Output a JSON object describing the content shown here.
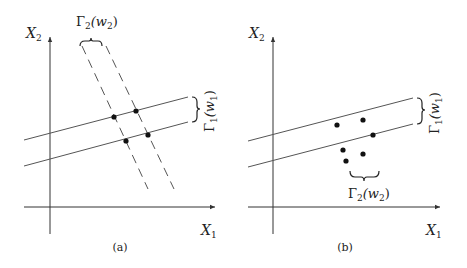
{
  "panels": [
    {
      "id": "a",
      "caption": "(a)",
      "x_axis_label": "X",
      "x_axis_sub": "1",
      "y_axis_label": "X",
      "y_axis_sub": "2",
      "gamma1_label": "Γ",
      "gamma1_sub": "1",
      "gamma1_arg": "(w",
      "gamma1_arg_sub": "1",
      "gamma1_close": ")",
      "gamma2_label": "Γ",
      "gamma2_sub": "2",
      "gamma2_arg": "(w",
      "gamma2_arg_sub": "2",
      "gamma2_close": ")",
      "points": 4
    },
    {
      "id": "b",
      "caption": "(b)",
      "x_axis_label": "X",
      "x_axis_sub": "1",
      "y_axis_label": "X",
      "y_axis_sub": "2",
      "gamma1_label": "Γ",
      "gamma1_sub": "1",
      "gamma1_arg": "(w",
      "gamma1_arg_sub": "1",
      "gamma1_close": ")",
      "gamma2_label": "Γ",
      "gamma2_sub": "2",
      "gamma2_arg": "(w",
      "gamma2_arg_sub": "2",
      "gamma2_close": ")",
      "points": 6
    }
  ]
}
